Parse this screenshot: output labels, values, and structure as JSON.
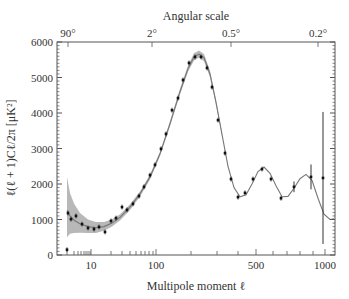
{
  "chart_data": {
    "type": "scatter",
    "title": "",
    "top_axis_title": "Angular scale",
    "top_ticks": [
      {
        "label": "90°",
        "x_px": 68
      },
      {
        "label": "2°",
        "x_px": 152
      },
      {
        "label": "0.5°",
        "x_px": 231
      },
      {
        "label": "0.2°",
        "x_px": 318
      }
    ],
    "xlabel": "Multipole moment ℓ",
    "ylabel": "ℓ(ℓ + 1)Cℓ/2π [μK²]",
    "ylim": [
      0,
      6000
    ],
    "yticks": [
      0,
      1000,
      2000,
      3000,
      4000,
      5000,
      6000
    ],
    "xticks_labeled": [
      {
        "label": "10",
        "value": 10
      },
      {
        "label": "100",
        "value": 100
      },
      {
        "label": "500",
        "value": 500
      },
      {
        "label": "1000",
        "value": 1000
      }
    ],
    "x_tick_map": [
      [
        2,
        67
      ],
      [
        3,
        74
      ],
      [
        4,
        78
      ],
      [
        5,
        81
      ],
      [
        6,
        84
      ],
      [
        7,
        86
      ],
      [
        8,
        88
      ],
      [
        9,
        90
      ],
      [
        10,
        91
      ],
      [
        20,
        111
      ],
      [
        30,
        122
      ],
      [
        40,
        130
      ],
      [
        50,
        136
      ],
      [
        60,
        141
      ],
      [
        70,
        145
      ],
      [
        80,
        149
      ],
      [
        90,
        153
      ],
      [
        100,
        156
      ],
      [
        200,
        191
      ],
      [
        300,
        217
      ],
      [
        400,
        238
      ],
      [
        500,
        256
      ],
      [
        600,
        273
      ],
      [
        700,
        287
      ],
      [
        800,
        300
      ],
      [
        900,
        313
      ],
      [
        1000,
        325
      ]
    ],
    "grid": false,
    "legend": null,
    "series": [
      {
        "name": "Measured data",
        "marker": "dot",
        "points": [
          {
            "x_px": 67,
            "y": 150
          },
          {
            "x_px": 68,
            "y": 1180
          },
          {
            "x_px": 71,
            "y": 1010
          },
          {
            "x_px": 76,
            "y": 1100
          },
          {
            "x_px": 82,
            "y": 870
          },
          {
            "x_px": 88,
            "y": 760
          },
          {
            "x_px": 94,
            "y": 730
          },
          {
            "x_px": 99,
            "y": 790
          },
          {
            "x_px": 105,
            "y": 650
          },
          {
            "x_px": 111,
            "y": 960
          },
          {
            "x_px": 116,
            "y": 1040
          },
          {
            "x_px": 122,
            "y": 1350
          },
          {
            "x_px": 127,
            "y": 1270
          },
          {
            "x_px": 133,
            "y": 1440
          },
          {
            "x_px": 139,
            "y": 1660
          },
          {
            "x_px": 144,
            "y": 1920
          },
          {
            "x_px": 150,
            "y": 2250
          },
          {
            "x_px": 155,
            "y": 2540
          },
          {
            "x_px": 161,
            "y": 2990
          },
          {
            "x_px": 166,
            "y": 3410
          },
          {
            "x_px": 172,
            "y": 4080
          },
          {
            "x_px": 178,
            "y": 4420
          },
          {
            "x_px": 183,
            "y": 4930
          },
          {
            "x_px": 189,
            "y": 5410
          },
          {
            "x_px": 195,
            "y": 5580
          },
          {
            "x_px": 201,
            "y": 5580
          },
          {
            "x_px": 207,
            "y": 5270
          },
          {
            "x_px": 212,
            "y": 4730
          },
          {
            "x_px": 218,
            "y": 3800
          },
          {
            "x_px": 225,
            "y": 2870
          },
          {
            "x_px": 231,
            "y": 2140
          },
          {
            "x_px": 238,
            "y": 1630
          },
          {
            "x_px": 245,
            "y": 1750
          },
          {
            "x_px": 253,
            "y": 2140
          },
          {
            "x_px": 262,
            "y": 2420
          },
          {
            "x_px": 271,
            "y": 2140
          },
          {
            "x_px": 281,
            "y": 1600
          },
          {
            "x_px": 294,
            "y": 1920,
            "err": 150
          },
          {
            "x_px": 311,
            "y": 2200,
            "err": 350
          },
          {
            "x_px": 323,
            "y": 2170,
            "err_low": 310,
            "err_high": 4030
          }
        ]
      },
      {
        "name": "Theoretical model",
        "type": "line",
        "points_px": [
          [
            67,
            1250
          ],
          [
            70,
            1100
          ],
          [
            74,
            980
          ],
          [
            80,
            880
          ],
          [
            88,
            800
          ],
          [
            96,
            770
          ],
          [
            104,
            800
          ],
          [
            112,
            900
          ],
          [
            120,
            1060
          ],
          [
            130,
            1350
          ],
          [
            140,
            1720
          ],
          [
            150,
            2200
          ],
          [
            160,
            2850
          ],
          [
            170,
            3700
          ],
          [
            180,
            4600
          ],
          [
            188,
            5250
          ],
          [
            194,
            5580
          ],
          [
            199,
            5660
          ],
          [
            204,
            5560
          ],
          [
            210,
            5100
          ],
          [
            216,
            4300
          ],
          [
            222,
            3400
          ],
          [
            228,
            2500
          ],
          [
            234,
            1900
          ],
          [
            240,
            1640
          ],
          [
            246,
            1700
          ],
          [
            252,
            2000
          ],
          [
            258,
            2350
          ],
          [
            264,
            2480
          ],
          [
            270,
            2300
          ],
          [
            276,
            1950
          ],
          [
            282,
            1640
          ],
          [
            288,
            1650
          ],
          [
            294,
            1880
          ],
          [
            300,
            2150
          ],
          [
            306,
            2270
          ],
          [
            312,
            2100
          ],
          [
            318,
            1600
          ],
          [
            324,
            1150
          ],
          [
            330,
            1000
          ],
          [
            334,
            1020
          ]
        ]
      },
      {
        "name": "Cosmic variance band",
        "type": "area",
        "upper_px": [
          [
            67,
            2200
          ],
          [
            70,
            1750
          ],
          [
            74,
            1450
          ],
          [
            80,
            1180
          ],
          [
            88,
            1000
          ],
          [
            96,
            930
          ],
          [
            104,
            930
          ],
          [
            112,
            1010
          ],
          [
            120,
            1150
          ],
          [
            130,
            1430
          ],
          [
            140,
            1790
          ],
          [
            150,
            2270
          ],
          [
            160,
            2910
          ],
          [
            170,
            3770
          ],
          [
            180,
            4680
          ],
          [
            188,
            5340
          ],
          [
            194,
            5680
          ],
          [
            199,
            5760
          ],
          [
            204,
            5660
          ],
          [
            210,
            5190
          ],
          [
            216,
            4370
          ],
          [
            222,
            3450
          ]
        ],
        "lower_px": [
          [
            67,
            500
          ],
          [
            70,
            600
          ],
          [
            74,
            620
          ],
          [
            80,
            630
          ],
          [
            88,
            620
          ],
          [
            96,
            620
          ],
          [
            104,
            680
          ],
          [
            112,
            800
          ],
          [
            120,
            970
          ],
          [
            130,
            1270
          ],
          [
            140,
            1650
          ],
          [
            150,
            2130
          ],
          [
            160,
            2790
          ],
          [
            170,
            3630
          ],
          [
            180,
            4520
          ],
          [
            188,
            5160
          ],
          [
            194,
            5480
          ],
          [
            199,
            5560
          ],
          [
            204,
            5460
          ],
          [
            210,
            5010
          ],
          [
            216,
            4230
          ],
          [
            222,
            3350
          ]
        ]
      }
    ]
  },
  "colors": {
    "axis": "#555555",
    "data": "#111111",
    "model_line": "#777777",
    "band": "#b8b8b8",
    "text": "#333333"
  }
}
